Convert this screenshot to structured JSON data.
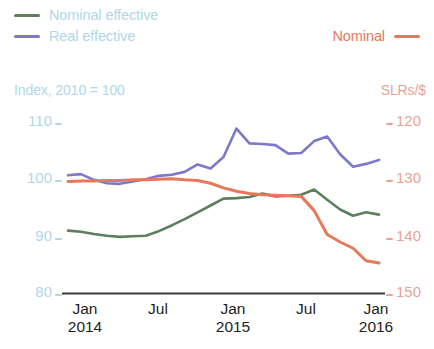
{
  "legend": {
    "entries": [
      {
        "label": "Nominal effective",
        "color": "#5D7F5B",
        "icon": "line-swatch"
      },
      {
        "label": "Real effective",
        "color": "#7B79C9",
        "icon": "line-swatch"
      },
      {
        "label": "Nominal",
        "color": "#E8785A",
        "icon": "line-swatch"
      }
    ]
  },
  "axes": {
    "left_caption": "Index, 2010 = 100",
    "right_caption": "SLRs/$",
    "left_ticks": [
      "110",
      "100",
      "90",
      "80"
    ],
    "right_ticks": [
      "120",
      "130",
      "140",
      "150"
    ],
    "x_ticks": [
      {
        "month": "Jan",
        "year": "2014"
      },
      {
        "month": "Jul",
        "year": ""
      },
      {
        "month": "Jan",
        "year": "2015"
      },
      {
        "month": "Jul",
        "year": ""
      },
      {
        "month": "Jan",
        "year": "2016"
      }
    ]
  },
  "colors": {
    "nominal_effective": "#5D7F5B",
    "real_effective": "#7B79C9",
    "nominal_rate": "#E8785A",
    "left_axis_text": "#AFD7EA",
    "right_axis_text": "#E9A390",
    "legend_text": "#AFD7EA",
    "baseline": "#3A3A3A",
    "x_label_text": "#231F20"
  },
  "chart_data": {
    "type": "line",
    "title": "",
    "subtitle": "",
    "xlabel": "",
    "ylabel": "Index, 2010 = 100",
    "y2label": "SLRs/$",
    "grid": false,
    "legend_position": "top",
    "ylim": [
      80,
      110
    ],
    "y2lim": [
      150,
      120
    ],
    "y2_inverted": true,
    "x": [
      "2014-01",
      "2014-02",
      "2014-03",
      "2014-04",
      "2014-05",
      "2014-06",
      "2014-07",
      "2014-08",
      "2014-09",
      "2014-10",
      "2014-11",
      "2014-12",
      "2015-01",
      "2015-02",
      "2015-03",
      "2015-04",
      "2015-05",
      "2015-06",
      "2015-07",
      "2015-08",
      "2015-09",
      "2015-10",
      "2015-11",
      "2015-12",
      "2016-01"
    ],
    "xtick_labels": [
      "Jan 2014",
      "Jul",
      "Jan 2015",
      "Jul",
      "Jan 2016"
    ],
    "series": [
      {
        "name": "Nominal effective",
        "axis": "left",
        "color": "#5D7F5B",
        "units": "Index, 2010 = 100",
        "values": [
          90.6,
          90.4,
          90.0,
          89.7,
          89.5,
          89.6,
          89.7,
          90.5,
          91.5,
          92.6,
          93.8,
          95.0,
          96.2,
          96.3,
          96.5,
          97.1,
          96.6,
          96.7,
          96.9,
          97.8,
          96.0,
          94.3,
          93.2,
          93.8,
          93.4
        ]
      },
      {
        "name": "Real effective",
        "axis": "left",
        "color": "#7B79C9",
        "units": "Index, 2010 = 100",
        "values": [
          100.3,
          100.5,
          99.5,
          98.9,
          98.8,
          99.2,
          99.6,
          100.2,
          100.4,
          100.9,
          102.2,
          101.5,
          103.5,
          108.5,
          105.9,
          105.8,
          105.6,
          104.1,
          104.2,
          106.3,
          107.1,
          104.0,
          101.8,
          102.3,
          103.0
        ]
      },
      {
        "name": "Nominal",
        "axis": "right",
        "color": "#E8785A",
        "units": "SLRs/$",
        "values": [
          130.8,
          130.7,
          130.7,
          130.6,
          130.6,
          130.5,
          130.5,
          130.4,
          130.3,
          130.5,
          130.6,
          131.1,
          131.9,
          132.5,
          132.9,
          133.1,
          133.2,
          133.3,
          133.4,
          135.9,
          140.1,
          141.4,
          142.5,
          144.7,
          145.1
        ]
      }
    ]
  }
}
